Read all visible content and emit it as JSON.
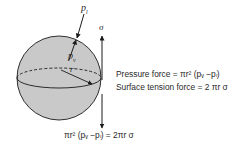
{
  "labels": {
    "p_l": "p",
    "p_l_sub": "l",
    "p_v": "p",
    "p_v_sub": "v",
    "sigma": "σ",
    "r": "r"
  },
  "equations": {
    "pressure_force": "Pressure force = πr² (pᵥ −pₗ)",
    "surface_tension_force": "Surface tension force = 2 πr σ",
    "balance": "πr² (pᵥ −pₗ) = 2πr σ"
  },
  "colors": {
    "sphere_fill": "#c9c9c9",
    "stroke": "#1a1a1a",
    "text": "#2a2a2a"
  }
}
